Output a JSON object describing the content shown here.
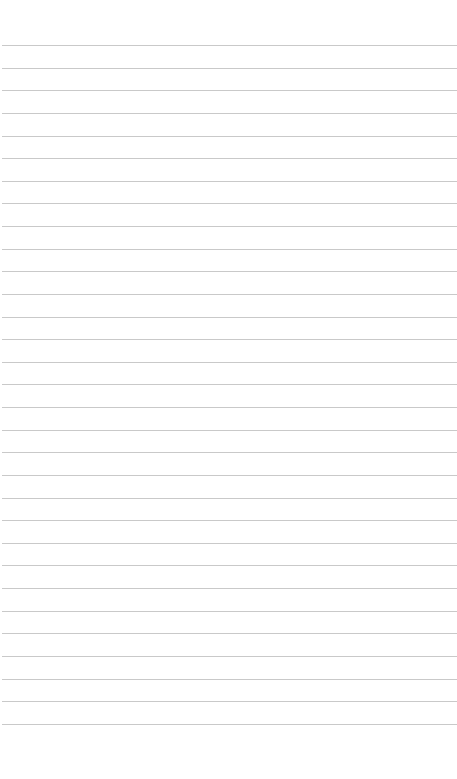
{
  "page": {
    "type": "lined-paper",
    "background_color": "#ffffff",
    "rule_color": "#c9c9c9",
    "rule_count": 31,
    "first_rule_y": 45,
    "rule_spacing": 22.63
  }
}
